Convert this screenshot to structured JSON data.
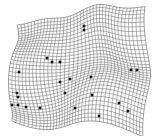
{
  "figure": {
    "type": "wireframe-surface-mesh",
    "title": "",
    "background_color": "#ffffff",
    "wire_color": "#1a1a1a",
    "marker_color": "#101010"
  },
  "chart_data": {
    "type": "scatter",
    "title": "",
    "xlabel": "",
    "ylabel": "",
    "grid": true,
    "legend": null,
    "surface": {
      "rows": 34,
      "cols": 38,
      "corners": {
        "top_left": [
          14,
          18
        ],
        "top_right": [
          148,
          10
        ],
        "bottom_right": [
          146,
          128
        ],
        "bottom_left": [
          10,
          122
        ]
      },
      "warp_amplitude": 7.5
    },
    "markers": [
      {
        "x": 84,
        "y": 26
      },
      {
        "x": 84,
        "y": 30
      },
      {
        "x": 47,
        "y": 58
      },
      {
        "x": 52,
        "y": 62
      },
      {
        "x": 60,
        "y": 62
      },
      {
        "x": 19,
        "y": 72
      },
      {
        "x": 131,
        "y": 70
      },
      {
        "x": 137,
        "y": 70
      },
      {
        "x": 91,
        "y": 77
      },
      {
        "x": 70,
        "y": 79
      },
      {
        "x": 60,
        "y": 82
      },
      {
        "x": 17,
        "y": 93
      },
      {
        "x": 18,
        "y": 97
      },
      {
        "x": 65,
        "y": 93
      },
      {
        "x": 92,
        "y": 95
      },
      {
        "x": 12,
        "y": 105
      },
      {
        "x": 18,
        "y": 105
      },
      {
        "x": 26,
        "y": 107
      },
      {
        "x": 40,
        "y": 108
      },
      {
        "x": 75,
        "y": 108
      },
      {
        "x": 119,
        "y": 103
      },
      {
        "x": 128,
        "y": 111
      },
      {
        "x": 99,
        "y": 116
      }
    ],
    "marker_size_px": 2.6,
    "marker_count": 23
  }
}
